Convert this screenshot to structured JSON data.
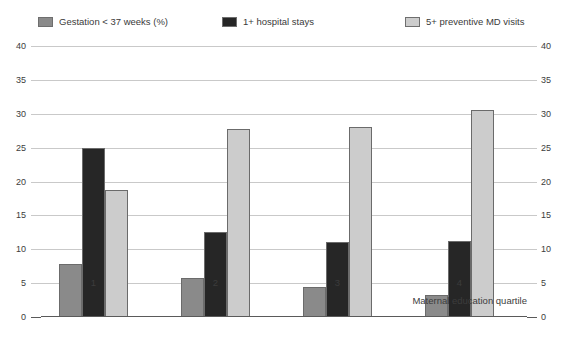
{
  "chart_data": {
    "type": "bar",
    "title": "",
    "subtitle": "",
    "xlabel": "Maternal education quartile",
    "ylabel": "",
    "categories": [
      "1",
      "2",
      "3",
      "4"
    ],
    "series": [
      {
        "name": "Gestation < 37 weeks (%)",
        "color": "#8a8a8a",
        "values": [
          7.8,
          5.8,
          4.4,
          3.3
        ]
      },
      {
        "name": "1+ hospital stays",
        "color": "#262626",
        "values": [
          24.9,
          12.5,
          11.0,
          11.2
        ]
      },
      {
        "name": "5+ preventive MD visits",
        "color": "#cccccc",
        "values": [
          18.8,
          27.8,
          28.0,
          30.5
        ]
      }
    ],
    "ylim": [
      0,
      40
    ],
    "yticks": [
      0,
      5,
      10,
      15,
      20,
      25,
      30,
      35,
      40
    ],
    "ytick_labels": [
      "0",
      "5",
      "10",
      "15",
      "20",
      "25",
      "30",
      "35",
      "40"
    ],
    "grid": true,
    "dual_y_axis": true,
    "legend_position": "top",
    "bar_edge_color": "#6b6b6b",
    "gridline_color": "#c9c9c9",
    "axis_color": "#5a5a5a",
    "background": "#ffffff"
  }
}
